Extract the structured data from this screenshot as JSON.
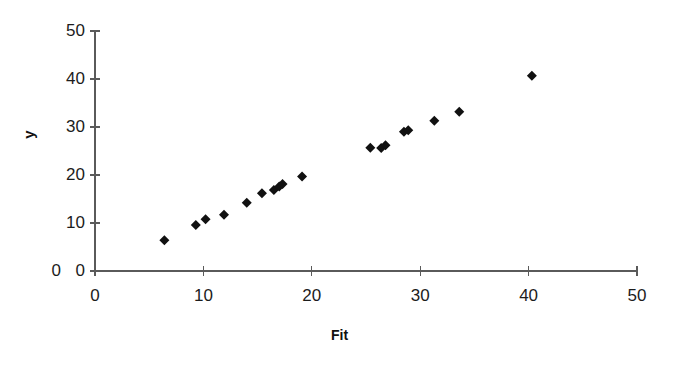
{
  "chart_data": {
    "type": "scatter",
    "title": "",
    "subtitle": "",
    "xlabel": "Fit",
    "ylabel": "y",
    "xlim": [
      0,
      50
    ],
    "ylim": [
      0,
      50
    ],
    "xticks": [
      0,
      10,
      20,
      30,
      40,
      50
    ],
    "yticks": [
      0,
      10,
      20,
      30,
      40,
      50
    ],
    "xtick_labels": [
      "0",
      "10",
      "20",
      "30",
      "40",
      "50"
    ],
    "ytick_labels": [
      "0",
      "10",
      "20",
      "30",
      "40",
      "50"
    ],
    "grid": false,
    "legend": false,
    "legend_position": "none",
    "marker": "diamond",
    "marker_color": "#111111",
    "marker_size": 9,
    "series": [
      {
        "name": "y vs Fit",
        "points": [
          {
            "x": 6.4,
            "y": 6.4
          },
          {
            "x": 9.3,
            "y": 9.6
          },
          {
            "x": 10.2,
            "y": 10.8
          },
          {
            "x": 11.9,
            "y": 11.7
          },
          {
            "x": 14.0,
            "y": 14.2
          },
          {
            "x": 15.4,
            "y": 16.2
          },
          {
            "x": 16.5,
            "y": 16.9
          },
          {
            "x": 17.0,
            "y": 17.6
          },
          {
            "x": 17.3,
            "y": 18.1
          },
          {
            "x": 19.1,
            "y": 19.7
          },
          {
            "x": 25.4,
            "y": 25.7
          },
          {
            "x": 26.4,
            "y": 25.6
          },
          {
            "x": 26.8,
            "y": 26.2
          },
          {
            "x": 28.5,
            "y": 29.0
          },
          {
            "x": 28.9,
            "y": 29.3
          },
          {
            "x": 31.3,
            "y": 31.3
          },
          {
            "x": 33.6,
            "y": 33.2
          },
          {
            "x": 40.3,
            "y": 40.7
          }
        ]
      }
    ],
    "annotations": [
      {
        "name": "duplicate-zero-label",
        "text": "0",
        "note": "extra 0 glyph rendered left of the y-axis zero label"
      }
    ]
  },
  "axes": {
    "y_axis_name": "y",
    "x_axis_name": "Fit"
  }
}
